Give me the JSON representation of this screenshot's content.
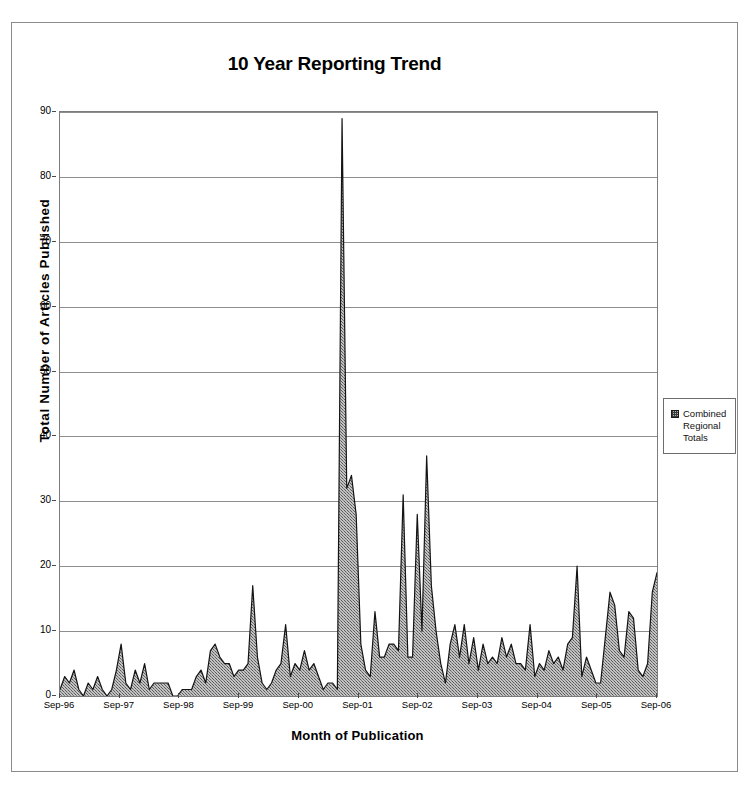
{
  "chart_data": {
    "type": "area",
    "title": "10 Year Reporting Trend",
    "xlabel": "Month of Publication",
    "ylabel": "Total Number of Articles Published",
    "ylim": [
      0,
      90
    ],
    "ytick_step": 10,
    "yticks": [
      0,
      10,
      20,
      30,
      40,
      50,
      60,
      70,
      80,
      90
    ],
    "xticks": [
      "Sep-96",
      "Sep-97",
      "Sep-98",
      "Sep-99",
      "Sep-00",
      "Sep-01",
      "Sep-02",
      "Sep-03",
      "Sep-04",
      "Sep-05",
      "Sep-06"
    ],
    "grid": true,
    "legend_position": "right",
    "series": [
      {
        "name": "Combined Regional Totals",
        "fill_color": "#b0b0b0",
        "line_color": "#1a1a1a",
        "values": [
          1,
          3,
          2,
          4,
          1,
          0,
          2,
          1,
          3,
          1,
          0,
          1,
          4,
          8,
          2,
          1,
          4,
          2,
          5,
          1,
          2,
          2,
          2,
          2,
          0,
          0,
          1,
          1,
          1,
          3,
          4,
          2,
          7,
          8,
          6,
          5,
          5,
          3,
          4,
          4,
          5,
          17,
          6,
          2,
          1,
          2,
          4,
          5,
          11,
          3,
          5,
          4,
          7,
          4,
          5,
          3,
          1,
          2,
          2,
          1,
          89,
          32,
          34,
          28,
          8,
          4,
          3,
          13,
          6,
          6,
          8,
          8,
          7,
          31,
          6,
          6,
          28,
          10,
          37,
          17,
          10,
          5,
          2,
          8,
          11,
          6,
          11,
          5,
          9,
          4,
          8,
          5,
          6,
          5,
          9,
          6,
          8,
          5,
          5,
          4,
          11,
          3,
          5,
          4,
          7,
          5,
          6,
          4,
          8,
          9,
          20,
          3,
          6,
          4,
          2,
          2,
          9,
          16,
          14,
          7,
          6,
          13,
          12,
          4,
          3,
          5,
          16,
          19
        ],
        "peak_value": 89,
        "peak_label": "Sep-01"
      }
    ]
  },
  "legend": {
    "entries": [
      {
        "label_line1": "Combined",
        "label_line2": "Regional",
        "label_line3": "Totals",
        "swatch": "pattern-swatch"
      }
    ]
  }
}
